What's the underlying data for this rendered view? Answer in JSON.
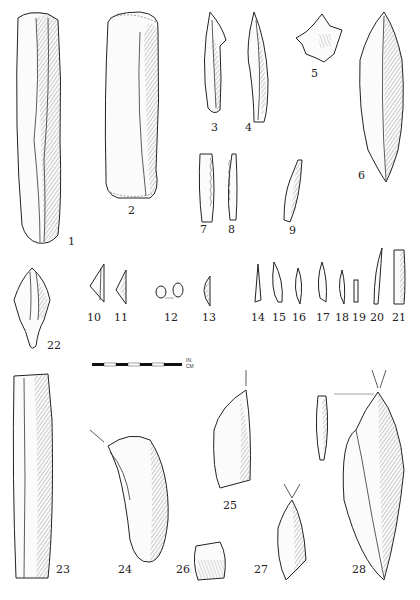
{
  "figure": {
    "type": "archaeological lithic illustration plate",
    "artifacts": [
      {
        "id": 1,
        "label": "1",
        "description": "long prismatic blade"
      },
      {
        "id": 2,
        "label": "2",
        "description": "end-scraper on blade"
      },
      {
        "id": 3,
        "label": "3",
        "description": "backed point"
      },
      {
        "id": 4,
        "label": "4",
        "description": "point"
      },
      {
        "id": 5,
        "label": "5",
        "description": "denticulate star-shaped piece"
      },
      {
        "id": 6,
        "label": "6",
        "description": "bifacially retouched point"
      },
      {
        "id": 7,
        "label": "7",
        "description": "denticulated blade"
      },
      {
        "id": 8,
        "label": "8",
        "description": "denticulated bladelet"
      },
      {
        "id": 9,
        "label": "9",
        "description": "bladelet point"
      },
      {
        "id": 10,
        "label": "10",
        "description": "triangle microlith"
      },
      {
        "id": 11,
        "label": "11",
        "description": "triangle microlith"
      },
      {
        "id": 12,
        "label": "12",
        "description": "lunate microliths (pair)"
      },
      {
        "id": 13,
        "label": "13",
        "description": "segment microlith"
      },
      {
        "id": 14,
        "label": "14",
        "description": "microlith"
      },
      {
        "id": 15,
        "label": "15",
        "description": "microlith"
      },
      {
        "id": 16,
        "label": "16",
        "description": "microlith"
      },
      {
        "id": 17,
        "label": "17",
        "description": "microlith"
      },
      {
        "id": 18,
        "label": "18",
        "description": "microlith"
      },
      {
        "id": 19,
        "label": "19",
        "description": "microlith"
      },
      {
        "id": 20,
        "label": "20",
        "description": "backed bladelet"
      },
      {
        "id": 21,
        "label": "21",
        "description": "backed bladelet"
      },
      {
        "id": 22,
        "label": "22",
        "description": "tanged point"
      },
      {
        "id": 23,
        "label": "23",
        "description": "large blade"
      },
      {
        "id": 24,
        "label": "24",
        "description": "curved scraper with burin blow"
      },
      {
        "id": 25,
        "label": "25",
        "description": "burin"
      },
      {
        "id": 26,
        "label": "26",
        "description": "small scraper"
      },
      {
        "id": 27,
        "label": "27",
        "description": "burin"
      },
      {
        "id": 28,
        "label": "28",
        "description": "dihedral burin with side view"
      }
    ]
  },
  "scale_bar": {
    "unit_top": "IN.",
    "unit_bottom": "CM"
  }
}
